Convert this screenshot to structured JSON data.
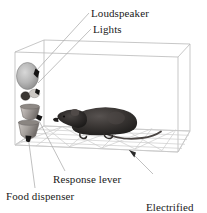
{
  "figure": {
    "title_text": "",
    "background_color": "#ffffff",
    "line_color": "#b9b9b9",
    "text_color": "#1a1a1a"
  },
  "labels": {
    "loudspeaker": "Loudspeaker",
    "lights": "Lights",
    "response_lever": "Response lever",
    "food_dispenser": "Food dispenser",
    "electrified_grid_line1": "Electrified",
    "electrified_grid_line2": "grid"
  },
  "parts": {
    "chamber": "chamber-box",
    "loudspeaker": "loudspeaker-cone",
    "lights": "signal-lights",
    "lever": "response-lever",
    "dispenser": "food-dispenser-cup",
    "grid_floor": "electrified-grid-floor",
    "animal": "rat"
  },
  "colors": {
    "speaker_light": "#cfcfcf",
    "speaker_dark": "#8e8e8e",
    "cup_light": "#c9c4c0",
    "cup_dark": "#6f6a67",
    "rat_body": "#3b3735",
    "rat_dark": "#201e1d",
    "grid_line": "#cccccc",
    "leader_line": "#a8a8a8",
    "arrow": "#2b2b2b"
  }
}
